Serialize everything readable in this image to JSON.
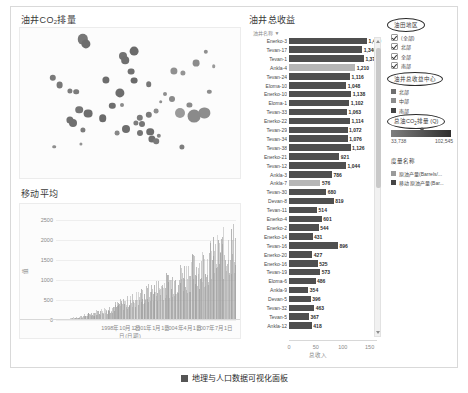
{
  "dashboard": {
    "scatter_panel": {
      "title_main": "油井CO",
      "title_sub": "2",
      "title_tail": "排量",
      "name": "oil-well-co2-emission"
    },
    "moving_average_panel": {
      "title": "移动平均",
      "y_ticks": [
        "2500",
        "2000",
        "1500",
        "1000",
        "500",
        "0"
      ],
      "x_ticks": [
        "1998年10月1日",
        "2001年1月1日",
        "2004年4月1日",
        "2007年7月1日"
      ],
      "x_label": "日(日期)",
      "y_label": "值"
    },
    "bar_panel": {
      "title": "油井总收益",
      "column_header": "油井名称",
      "sort_caret": "▼",
      "x_ticks": [
        "0",
        "50",
        "100",
        "150"
      ],
      "x_label": "总收入",
      "rows": [
        {
          "label": "Enerko-3",
          "value": 1429,
          "display": "1,429",
          "highlight": false
        },
        {
          "label": "Tevan-17",
          "value": 1340,
          "display": "1,340",
          "highlight": false
        },
        {
          "label": "Tevan-1",
          "value": 1370,
          "display": "1,370",
          "highlight": false
        },
        {
          "label": "Ankla-4",
          "value": 1210,
          "display": "1,210",
          "highlight": true
        },
        {
          "label": "Tevan-24",
          "value": 1116,
          "display": "1,116",
          "highlight": false
        },
        {
          "label": "Eloma-10",
          "value": 1048,
          "display": "1,048",
          "highlight": false
        },
        {
          "label": "Enerko-10",
          "value": 1138,
          "display": "1,138",
          "highlight": false
        },
        {
          "label": "Eloma-1",
          "value": 1102,
          "display": "1,102",
          "highlight": false
        },
        {
          "label": "Tevan-33",
          "value": 1063,
          "display": "1,063",
          "highlight": false
        },
        {
          "label": "Enerko-22",
          "value": 1114,
          "display": "1,114",
          "highlight": false
        },
        {
          "label": "Tevan-29",
          "value": 1072,
          "display": "1,072",
          "highlight": false
        },
        {
          "label": "Tevan-34",
          "value": 1076,
          "display": "1,076",
          "highlight": false
        },
        {
          "label": "Tevan-38",
          "value": 1126,
          "display": "1,126",
          "highlight": false
        },
        {
          "label": "Enerko-21",
          "value": 921,
          "display": "921",
          "highlight": false
        },
        {
          "label": "Tevan-12",
          "value": 1044,
          "display": "1,044",
          "highlight": false
        },
        {
          "label": "Ankla-3",
          "value": 786,
          "display": "786",
          "highlight": false
        },
        {
          "label": "Ankla-7",
          "value": 576,
          "display": "576",
          "highlight": true
        },
        {
          "label": "Tevan-30",
          "value": 680,
          "display": "680",
          "highlight": false
        },
        {
          "label": "Devan-8",
          "value": 819,
          "display": "819",
          "highlight": false
        },
        {
          "label": "Tevan-11",
          "value": 514,
          "display": "514",
          "highlight": false
        },
        {
          "label": "Enerko-4",
          "value": 601,
          "display": "601",
          "highlight": false
        },
        {
          "label": "Enerko-2",
          "value": 544,
          "display": "544",
          "highlight": false
        },
        {
          "label": "Enerko-14",
          "value": 431,
          "display": "431",
          "highlight": false
        },
        {
          "label": "Tevan-16",
          "value": 896,
          "display": "896",
          "highlight": false
        },
        {
          "label": "Enerko-20",
          "value": 427,
          "display": "427",
          "highlight": false
        },
        {
          "label": "Enerko-16",
          "value": 525,
          "display": "525",
          "highlight": false
        },
        {
          "label": "Tevan-19",
          "value": 573,
          "display": "573",
          "highlight": false
        },
        {
          "label": "Eloma-6",
          "value": 486,
          "display": "486",
          "highlight": false
        },
        {
          "label": "Ankla-9",
          "value": 354,
          "display": "354",
          "highlight": false
        },
        {
          "label": "Devan-5",
          "value": 396,
          "display": "396",
          "highlight": false
        },
        {
          "label": "Tevan-32",
          "value": 463,
          "display": "463",
          "highlight": false
        },
        {
          "label": "Tevan-5",
          "value": 367,
          "display": "367",
          "highlight": false
        },
        {
          "label": "Ankla-12",
          "value": 418,
          "display": "418",
          "highlight": false
        }
      ]
    },
    "legend_rail": {
      "region_filter": {
        "title": "油田地区",
        "items": [
          {
            "label": "(全部)",
            "checked": true
          },
          {
            "label": "北部",
            "checked": true
          },
          {
            "label": "全部",
            "checked": true
          },
          {
            "label": "南部",
            "checked": true
          }
        ]
      },
      "color_legend": {
        "title": "油井总收益中心",
        "items": [
          {
            "label": "北部",
            "color": "#6f6f6f"
          },
          {
            "label": "中部",
            "color": "#8c8c8c"
          },
          {
            "label": "南部",
            "color": "#454545"
          }
        ]
      },
      "gradient_legend": {
        "title_main": "总油CO",
        "title_sub": "2",
        "title_tail": "排量 (Q)",
        "min": "33,738",
        "max": "102,545",
        "color_from": "#7e7e7e",
        "color_to": "#2f2f2f"
      },
      "measure_legend": {
        "title": "度量名称",
        "items": [
          {
            "label": "原油产量(Barrels/...",
            "color": "#9a9a9a"
          },
          {
            "label": "移动 原油产量(Bar...",
            "color": "#454545"
          }
        ]
      }
    },
    "scrollbar": {
      "up_arrow": "▲",
      "down_arrow": "▼"
    }
  },
  "caption": {
    "figure_label": "图",
    "text": "地理与人口数据可视化面板"
  },
  "chart_data": [
    {
      "type": "scatter",
      "title": "油井CO2排量",
      "xlabel": "",
      "ylabel": "",
      "grid": false,
      "legend": "none",
      "points": [
        {
          "x": 0.285,
          "y": 0.075,
          "r": 5.2,
          "c": "#777777"
        },
        {
          "x": 0.3,
          "y": 0.105,
          "r": 4.6,
          "c": "#6e6e6e"
        },
        {
          "x": 0.52,
          "y": 0.155,
          "r": 4.4,
          "c": "#6b6b6b"
        },
        {
          "x": 0.47,
          "y": 0.185,
          "r": 4.0,
          "c": "#737373"
        },
        {
          "x": 0.478,
          "y": 0.215,
          "r": 3.8,
          "c": "#6f6f6f"
        },
        {
          "x": 0.845,
          "y": 0.16,
          "r": 2.2,
          "c": "#8f8f8f"
        },
        {
          "x": 0.8,
          "y": 0.235,
          "r": 3.4,
          "c": "#8c8c8c"
        },
        {
          "x": 0.88,
          "y": 0.255,
          "r": 1.8,
          "c": "#9a9a9a"
        },
        {
          "x": 0.7,
          "y": 0.285,
          "r": 3.6,
          "c": "#909090"
        },
        {
          "x": 0.74,
          "y": 0.3,
          "r": 2.6,
          "c": "#949494"
        },
        {
          "x": 0.505,
          "y": 0.29,
          "r": 3.4,
          "c": "#707070"
        },
        {
          "x": 0.15,
          "y": 0.33,
          "r": 3.2,
          "c": "#7a7a7a"
        },
        {
          "x": 0.39,
          "y": 0.345,
          "r": 3.6,
          "c": "#6d6d6d"
        },
        {
          "x": 0.52,
          "y": 0.35,
          "r": 3.4,
          "c": "#6a6a6a"
        },
        {
          "x": 0.18,
          "y": 0.38,
          "r": 3.4,
          "c": "#787878"
        },
        {
          "x": 0.585,
          "y": 0.375,
          "r": 2.8,
          "c": "#777777"
        },
        {
          "x": 0.228,
          "y": 0.42,
          "r": 2.6,
          "c": "#7d7d7d"
        },
        {
          "x": 0.255,
          "y": 0.425,
          "r": 2.8,
          "c": "#7b7b7b"
        },
        {
          "x": 0.455,
          "y": 0.43,
          "r": 4.6,
          "c": "#6d6d6d"
        },
        {
          "x": 0.64,
          "y": 0.49,
          "r": 1.8,
          "c": "#8f8f8f"
        },
        {
          "x": 0.69,
          "y": 0.475,
          "r": 3.0,
          "c": "#8a8a8a"
        },
        {
          "x": 0.77,
          "y": 0.515,
          "r": 2.6,
          "c": "#8a8a8a"
        },
        {
          "x": 0.42,
          "y": 0.52,
          "r": 3.2,
          "c": "#6e6e6e"
        },
        {
          "x": 0.465,
          "y": 0.51,
          "r": 2.0,
          "c": "#8b8b8b"
        },
        {
          "x": 0.27,
          "y": 0.545,
          "r": 3.8,
          "c": "#757575"
        },
        {
          "x": 0.308,
          "y": 0.57,
          "r": 4.4,
          "c": "#6d6d6d"
        },
        {
          "x": 0.62,
          "y": 0.555,
          "r": 2.4,
          "c": "#8e8e8e"
        },
        {
          "x": 0.585,
          "y": 0.58,
          "r": 3.2,
          "c": "#7b7b7b"
        },
        {
          "x": 0.725,
          "y": 0.565,
          "r": 5.0,
          "c": "#9a9a9a"
        },
        {
          "x": 0.838,
          "y": 0.565,
          "r": 5.6,
          "c": "#8d8d8d"
        },
        {
          "x": 0.79,
          "y": 0.585,
          "r": 6.4,
          "c": "#8a8a8a"
        },
        {
          "x": 0.225,
          "y": 0.61,
          "r": 3.6,
          "c": "#717171"
        },
        {
          "x": 0.24,
          "y": 0.63,
          "r": 4.0,
          "c": "#6f6f6f"
        },
        {
          "x": 0.375,
          "y": 0.6,
          "r": 3.8,
          "c": "#6b6b6b"
        },
        {
          "x": 0.545,
          "y": 0.6,
          "r": 3.2,
          "c": "#7b7b7b"
        },
        {
          "x": 0.555,
          "y": 0.64,
          "r": 3.0,
          "c": "#767676"
        },
        {
          "x": 0.525,
          "y": 0.63,
          "r": 2.6,
          "c": "#7d7d7d"
        },
        {
          "x": 0.285,
          "y": 0.68,
          "r": 2.6,
          "c": "#7c7c7c"
        },
        {
          "x": 0.48,
          "y": 0.67,
          "r": 4.0,
          "c": "#6e6e6e"
        },
        {
          "x": 0.44,
          "y": 0.7,
          "r": 2.4,
          "c": "#888888"
        },
        {
          "x": 0.545,
          "y": 0.7,
          "r": 3.0,
          "c": "#757575"
        },
        {
          "x": 0.592,
          "y": 0.69,
          "r": 3.8,
          "c": "#6d6d6d"
        },
        {
          "x": 0.6,
          "y": 0.74,
          "r": 3.6,
          "c": "#6f6f6f"
        },
        {
          "x": 0.618,
          "y": 0.755,
          "r": 2.8,
          "c": "#7a7a7a"
        },
        {
          "x": 0.63,
          "y": 0.72,
          "r": 2.2,
          "c": "#868686"
        },
        {
          "x": 0.155,
          "y": 0.79,
          "r": 1.8,
          "c": "#8e8e8e"
        },
        {
          "x": 0.275,
          "y": 0.775,
          "r": 1.6,
          "c": "#949494"
        },
        {
          "x": 0.735,
          "y": 0.795,
          "r": 2.6,
          "c": "#7e7e7e"
        },
        {
          "x": 0.66,
          "y": 0.44,
          "r": 2.0,
          "c": "#8e8e8e"
        },
        {
          "x": 0.86,
          "y": 0.425,
          "r": 2.2,
          "c": "#8c8c8c"
        }
      ]
    },
    {
      "type": "area",
      "title": "移动平均",
      "xlabel": "日(日期)",
      "ylabel": "值",
      "ylim": [
        0,
        2750
      ],
      "y_ticks": [
        0,
        500,
        1000,
        1500,
        2000,
        2500
      ],
      "x_ticks": [
        "1998年10月1日",
        "2001年1月1日",
        "2004年4月1日",
        "2007年7月1日"
      ],
      "grid": true,
      "description": "密集锯齿状时间序列，自左向右从 0 增长至约 2600"
    },
    {
      "type": "bar",
      "title": "油井总收益",
      "xlabel": "总收入",
      "ylabel": "油井名称",
      "xlim": [
        0,
        150
      ],
      "x_ticks": [
        0,
        50,
        100,
        150
      ],
      "orientation": "horizontal",
      "categories": [
        "Enerko-3",
        "Tevan-17",
        "Tevan-1",
        "Ankla-4",
        "Tevan-24",
        "Eloma-10",
        "Enerko-10",
        "Eloma-1",
        "Tevan-33",
        "Enerko-22",
        "Tevan-29",
        "Tevan-34",
        "Tevan-38",
        "Enerko-21",
        "Tevan-12",
        "Ankla-3",
        "Ankla-7",
        "Tevan-30",
        "Devan-8",
        "Tevan-11",
        "Enerko-4",
        "Enerko-2",
        "Enerko-14",
        "Tevan-16",
        "Enerko-20",
        "Enerko-16",
        "Tevan-19",
        "Eloma-6",
        "Ankla-9",
        "Devan-5",
        "Tevan-32",
        "Tevan-5",
        "Ankla-12"
      ],
      "values": [
        1429,
        1340,
        1370,
        1210,
        1116,
        1048,
        1138,
        1102,
        1063,
        1114,
        1072,
        1076,
        1126,
        921,
        1044,
        786,
        576,
        680,
        819,
        514,
        601,
        544,
        431,
        896,
        427,
        525,
        573,
        486,
        354,
        396,
        463,
        367,
        418
      ]
    }
  ]
}
